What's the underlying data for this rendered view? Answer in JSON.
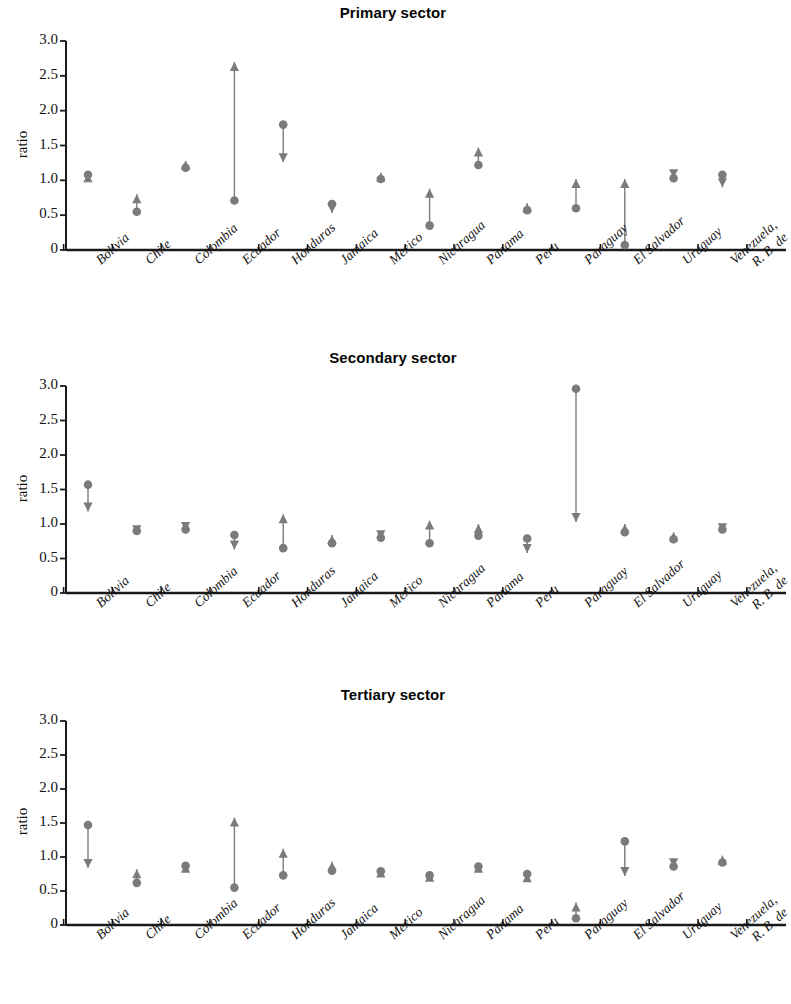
{
  "figure": {
    "marker_color": "#7b7b7b",
    "axis_color": "#1a1a1a",
    "ylabel": "ratio",
    "yticks": [
      "3.0",
      "2.5",
      "2.0",
      "1.5",
      "1.0",
      "0.5",
      "0"
    ],
    "ylim": [
      0,
      3.0
    ],
    "categories": [
      "Bolivia",
      "Chile",
      "Colombia",
      "Ecuador",
      "Honduras",
      "Jamaica",
      "Mexico",
      "Nicaragua",
      "Panama",
      "Peru",
      "Paraguay",
      "El Salvador",
      "Uruguay",
      "Venezuela, R. B. de"
    ]
  },
  "chart_data": [
    {
      "type": "scatter",
      "title": "Primary sector",
      "xlabel": "",
      "ylabel": "ratio",
      "ylim": [
        0,
        3.0
      ],
      "yticks": [
        0,
        0.5,
        1.0,
        1.5,
        2.0,
        2.5,
        3.0
      ],
      "grid": false,
      "legend": "none",
      "categories": [
        "Bolivia",
        "Chile",
        "Colombia",
        "Ecuador",
        "Honduras",
        "Jamaica",
        "Mexico",
        "Nicaragua",
        "Panama",
        "Peru",
        "Paraguay",
        "El Salvador",
        "Uruguay",
        "Venezuela, R. B. de"
      ],
      "series": [
        {
          "name": "circle",
          "values": [
            1.08,
            0.55,
            1.18,
            0.71,
            1.8,
            0.66,
            1.02,
            0.35,
            1.22,
            0.57,
            0.6,
            0.07,
            1.03,
            1.08
          ]
        },
        {
          "name": "arrow",
          "values": [
            1.1,
            0.8,
            1.28,
            2.7,
            1.26,
            0.53,
            1.11,
            0.88,
            1.47,
            0.67,
            1.02,
            1.02,
            1.03,
            0.9
          ]
        }
      ]
    },
    {
      "type": "scatter",
      "title": "Secondary sector",
      "xlabel": "",
      "ylabel": "ratio",
      "ylim": [
        0,
        3.0
      ],
      "yticks": [
        0,
        0.5,
        1.0,
        1.5,
        2.0,
        2.5,
        3.0
      ],
      "grid": false,
      "legend": "none",
      "categories": [
        "Bolivia",
        "Chile",
        "Colombia",
        "Ecuador",
        "Honduras",
        "Jamaica",
        "Mexico",
        "Nicaragua",
        "Panama",
        "Peru",
        "Paraguay",
        "El Salvador",
        "Uruguay",
        "Venezuela, R. B. de"
      ],
      "series": [
        {
          "name": "circle",
          "values": [
            1.57,
            0.9,
            0.92,
            0.84,
            0.65,
            0.72,
            0.8,
            0.72,
            0.83,
            0.79,
            2.96,
            0.88,
            0.78,
            0.92
          ]
        },
        {
          "name": "arrow",
          "values": [
            1.18,
            0.85,
            0.9,
            0.63,
            1.14,
            0.84,
            0.78,
            1.05,
            1.0,
            0.58,
            1.03,
            1.0,
            0.88,
            0.88
          ]
        }
      ]
    },
    {
      "type": "scatter",
      "title": "Tertiary sector",
      "xlabel": "",
      "ylabel": "ratio",
      "ylim": [
        0,
        3.0
      ],
      "yticks": [
        0,
        0.5,
        1.0,
        1.5,
        2.0,
        2.5,
        3.0
      ],
      "grid": false,
      "legend": "none",
      "categories": [
        "Bolivia",
        "Chile",
        "Colombia",
        "Ecuador",
        "Honduras",
        "Jamaica",
        "Mexico",
        "Nicaragua",
        "Panama",
        "Peru",
        "Paraguay",
        "El Salvador",
        "Uruguay",
        "Venezuela, R. B. de"
      ],
      "series": [
        {
          "name": "circle",
          "values": [
            1.47,
            0.62,
            0.87,
            0.55,
            0.73,
            0.8,
            0.79,
            0.73,
            0.86,
            0.75,
            0.1,
            1.23,
            0.86,
            0.92
          ]
        },
        {
          "name": "arrow",
          "values": [
            0.84,
            0.82,
            0.9,
            1.58,
            1.12,
            0.93,
            0.83,
            0.77,
            0.9,
            0.76,
            0.33,
            0.72,
            0.85,
            1.02
          ]
        }
      ]
    }
  ]
}
